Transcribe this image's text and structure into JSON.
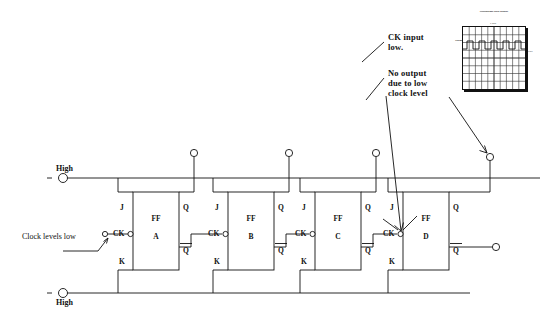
{
  "annotations": [
    {
      "id": "ck-input-low",
      "text": "CK input\nlow.",
      "x": 388,
      "y": 32
    },
    {
      "id": "no-output",
      "text": "No output\ndue to low\nclock level",
      "x": 388,
      "y": 68
    }
  ],
  "rails": {
    "top_label": "High",
    "bottom_label": "High",
    "clock_note": "Clock levels low"
  },
  "flipflops": [
    {
      "id": "A",
      "name_line1": "FF",
      "name_line2": "A",
      "pins": {
        "j": "J",
        "k": "K",
        "ck": "CK",
        "q": "Q",
        "qbar": "Q"
      }
    },
    {
      "id": "B",
      "name_line1": "FF",
      "name_line2": "B",
      "pins": {
        "j": "J",
        "k": "K",
        "ck": "CK",
        "q": "Q",
        "qbar": "Q"
      }
    },
    {
      "id": "C",
      "name_line1": "FF",
      "name_line2": "C",
      "pins": {
        "j": "J",
        "k": "K",
        "ck": "CK",
        "q": "Q",
        "qbar": "Q"
      }
    },
    {
      "id": "D",
      "name_line1": "FF",
      "name_line2": "D",
      "pins": {
        "j": "J",
        "k": "K",
        "ck": "CK",
        "q": "Q",
        "qbar": "Q"
      }
    }
  ],
  "scope": {
    "title": "Oscilloscope Data Display",
    "subtitle": "x axis",
    "x_label": "Time (ms)",
    "y_label": "Voltage",
    "right_label": "1 V/div",
    "trace": "square-wave",
    "grid_cols": 10,
    "grid_rows": 8
  },
  "colors": {
    "line": "#111111",
    "background": "#ffffff",
    "text": "#111111"
  }
}
